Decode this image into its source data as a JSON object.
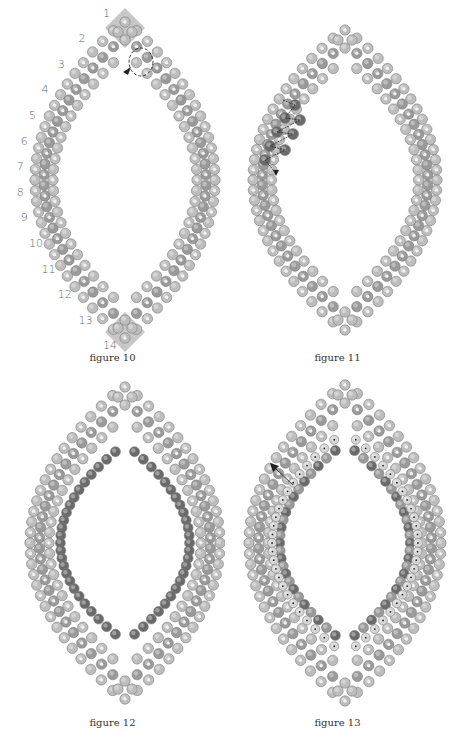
{
  "figures": [
    {
      "id": "figure-10",
      "caption": "figure 10",
      "panel": {
        "x": 0,
        "y": 0
      },
      "center": {
        "x": 125,
        "y": 180
      },
      "half_height": 160,
      "half_width": 90,
      "caption_y": 352,
      "row_labels": [
        "1",
        "2",
        "3",
        "4",
        "5",
        "6",
        "7",
        "8",
        "9",
        "10",
        "11",
        "12",
        "13",
        "14"
      ],
      "highlight_diamonds": true,
      "inner_ring": false,
      "thread_path": "loop-top"
    },
    {
      "id": "figure-11",
      "caption": "figure 11",
      "panel": {
        "x": 225,
        "y": 0
      },
      "center": {
        "x": 120,
        "y": 180
      },
      "half_height": 152,
      "half_width": 92,
      "caption_y": 352,
      "row_labels": [],
      "highlight_diamonds": false,
      "inner_ring": false,
      "dark_cluster": true,
      "thread_path": "zigzag-left"
    },
    {
      "id": "figure-12",
      "caption": "figure 12",
      "panel": {
        "x": 0,
        "y": 365
      },
      "center": {
        "x": 125,
        "y": 178
      },
      "half_height": 158,
      "half_width": 95,
      "caption_y": 352,
      "row_labels": [],
      "highlight_diamonds": false,
      "inner_ring": true,
      "inner_style": "dark"
    },
    {
      "id": "figure-13",
      "caption": "figure 13",
      "panel": {
        "x": 225,
        "y": 365
      },
      "center": {
        "x": 120,
        "y": 178
      },
      "half_height": 160,
      "half_width": 96,
      "caption_y": 352,
      "row_labels": [],
      "highlight_diamonds": false,
      "inner_ring": true,
      "inner_style": "mixed",
      "arrow": "up-left"
    }
  ],
  "colors": {
    "bead_light": "#bdbdbd",
    "bead_mid": "#9a9a9a",
    "bead_dark": "#6a6a6a",
    "bead_hole": "#f2f2f2",
    "diamond": "#b9b9b9",
    "thread": "#222222",
    "label": "#666666"
  }
}
